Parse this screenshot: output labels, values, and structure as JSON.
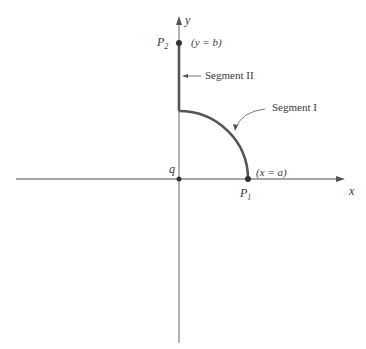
{
  "figure": {
    "colors": {
      "axis": "#8a8a8a",
      "curve": "#555555",
      "text": "#3a3a3a",
      "point": "#333333"
    },
    "axes": {
      "x_label": "x",
      "y_label": "y",
      "origin_label": "q"
    },
    "points": {
      "p1": {
        "name": "P",
        "subscript": "1",
        "condition": "(x = a)"
      },
      "p2": {
        "name": "P",
        "subscript": "2",
        "condition": "(y = b)"
      }
    },
    "segments": {
      "segment_1_label": "Segment I",
      "segment_2_label": "Segment II"
    }
  }
}
